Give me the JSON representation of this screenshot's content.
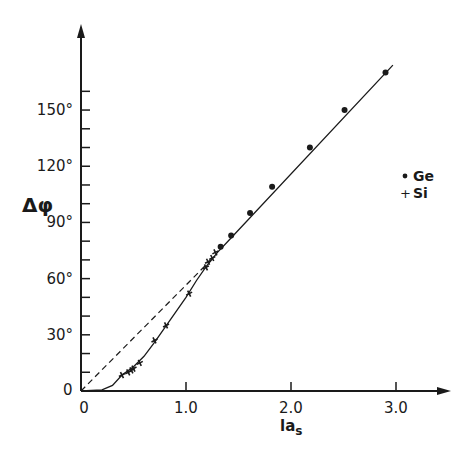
{
  "chart_data": {
    "type": "scatter",
    "title": "",
    "xlabel": "la_s",
    "ylabel": "Δφ",
    "xlim": [
      0,
      3.4
    ],
    "ylim": [
      0,
      180
    ],
    "grid": false,
    "legend_position": "right",
    "x_ticks": [
      "0",
      "1.0",
      "2.0",
      "3.0"
    ],
    "y_ticks": [
      "0",
      "30°",
      "60°",
      "90°",
      "120°",
      "150°"
    ],
    "y_minor_tick_step": 10,
    "series": [
      {
        "name": "Ge",
        "marker": "dot",
        "points": [
          [
            1.33,
            77
          ],
          [
            1.43,
            83
          ],
          [
            1.61,
            95
          ],
          [
            1.82,
            109
          ],
          [
            2.18,
            130
          ],
          [
            2.51,
            150
          ],
          [
            2.9,
            170
          ]
        ]
      },
      {
        "name": "Si",
        "marker": "plus",
        "points": [
          [
            0.39,
            8.5
          ],
          [
            0.45,
            10
          ],
          [
            0.48,
            11
          ],
          [
            0.5,
            12
          ],
          [
            0.56,
            15
          ],
          [
            0.7,
            27
          ],
          [
            0.81,
            35
          ],
          [
            1.03,
            52
          ],
          [
            1.19,
            66
          ],
          [
            1.21,
            69
          ],
          [
            1.25,
            71
          ],
          [
            1.28,
            74
          ]
        ]
      }
    ],
    "curves": [
      {
        "name": "theory-solid",
        "style": "solid",
        "description": "curve starting at origin, bending up to join straight line near la_s≈1.2, then linear to ~3.0"
      },
      {
        "name": "asymptote-dashed",
        "style": "dashed",
        "description": "straight line from origin extrapolating the linear part, merges near la_s≈1.2"
      }
    ]
  },
  "axes": {
    "x_label_main": "la",
    "x_label_sub": "s",
    "y_label": "Δφ",
    "origin_x": "0",
    "origin_y": "0"
  },
  "legend": {
    "items": [
      {
        "symbol": "•",
        "label": "Ge"
      },
      {
        "symbol": "+",
        "label": "Si"
      }
    ]
  }
}
